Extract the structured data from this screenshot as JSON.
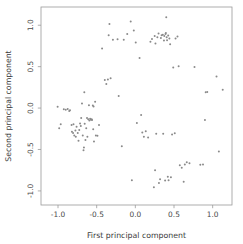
{
  "chart_data": {
    "type": "scatter",
    "title": "",
    "xlabel": "First principal component",
    "ylabel": "Second principal component",
    "xlim": [
      -1.22,
      1.25
    ],
    "ylim": [
      -1.17,
      1.22
    ],
    "xticks": [
      -1.0,
      -0.5,
      0.0,
      0.5,
      1.0
    ],
    "yticks": [
      -1.0,
      -0.5,
      0.0,
      0.5,
      1.0
    ],
    "xticklabels": [
      "-1.0",
      "-0.5",
      "0.0",
      "0.5",
      "1.0"
    ],
    "yticklabels": [
      "-1.0",
      "-0.5",
      "0.0",
      "0.5",
      "1.0"
    ],
    "grid": false,
    "legend": null,
    "marker_color": "#8a8a8a",
    "marker_size": 2.0,
    "n_points": 118,
    "series": [
      {
        "name": "samples",
        "points": [
          [
            -1.005,
            0.015
          ],
          [
            -0.985,
            -0.245
          ],
          [
            -0.965,
            -0.195
          ],
          [
            -0.925,
            -0.015
          ],
          [
            -0.9,
            -0.02
          ],
          [
            -0.875,
            -0.01
          ],
          [
            -0.855,
            -0.035
          ],
          [
            -0.845,
            -0.025
          ],
          [
            -0.825,
            -0.205
          ],
          [
            -0.82,
            -0.285
          ],
          [
            -0.805,
            -0.3
          ],
          [
            -0.8,
            -0.195
          ],
          [
            -0.79,
            -0.33
          ],
          [
            -0.775,
            -0.27
          ],
          [
            -0.77,
            -0.345
          ],
          [
            -0.76,
            -0.225
          ],
          [
            -0.745,
            -0.3
          ],
          [
            -0.735,
            -0.395
          ],
          [
            -0.725,
            -0.265
          ],
          [
            -0.715,
            -0.185
          ],
          [
            -0.705,
            -0.215
          ],
          [
            -0.7,
            -0.12
          ],
          [
            -0.69,
            0.055
          ],
          [
            -0.68,
            -0.33
          ],
          [
            -0.67,
            -0.51
          ],
          [
            -0.665,
            -0.475
          ],
          [
            -0.66,
            0.19
          ],
          [
            -0.655,
            -0.19
          ],
          [
            -0.645,
            -0.385
          ],
          [
            -0.635,
            -0.245
          ],
          [
            -0.625,
            -0.12
          ],
          [
            -0.62,
            -0.345
          ],
          [
            -0.61,
            -0.135
          ],
          [
            -0.6,
            0.035
          ],
          [
            -0.595,
            -0.15
          ],
          [
            -0.585,
            -0.13
          ],
          [
            -0.575,
            -0.14
          ],
          [
            -0.565,
            -0.135
          ],
          [
            -0.56,
            -0.145
          ],
          [
            -0.55,
            0.03
          ],
          [
            -0.545,
            -0.255
          ],
          [
            -0.54,
            0.02
          ],
          [
            -0.535,
            -0.405
          ],
          [
            -0.52,
            0.075
          ],
          [
            -0.51,
            -0.33
          ],
          [
            -0.49,
            -0.335
          ],
          [
            -0.47,
            -0.205
          ],
          [
            -0.43,
            0.72
          ],
          [
            -0.395,
            0.34
          ],
          [
            -0.375,
            0.29
          ],
          [
            -0.355,
            0.345
          ],
          [
            -0.345,
            0.88
          ],
          [
            -0.335,
            1.015
          ],
          [
            -0.32,
            0.36
          ],
          [
            -0.29,
            0.825
          ],
          [
            -0.23,
            0.83
          ],
          [
            -0.215,
            0.145
          ],
          [
            -0.175,
            -0.46
          ],
          [
            -0.15,
            0.825
          ],
          [
            -0.105,
            0.895
          ],
          [
            -0.06,
            1.045
          ],
          [
            -0.045,
            -0.87
          ],
          [
            -0.02,
            0.935
          ],
          [
            0.005,
            0.79
          ],
          [
            0.02,
            -0.18
          ],
          [
            0.055,
            0.605
          ],
          [
            0.075,
            -0.085
          ],
          [
            0.09,
            -0.295
          ],
          [
            0.11,
            -0.345
          ],
          [
            0.135,
            -0.28
          ],
          [
            0.165,
            -0.355
          ],
          [
            0.195,
            0.8
          ],
          [
            0.215,
            0.835
          ],
          [
            0.24,
            -0.955
          ],
          [
            0.25,
            0.87
          ],
          [
            0.255,
            -0.75
          ],
          [
            0.26,
            0.78
          ],
          [
            0.27,
            -0.31
          ],
          [
            0.285,
            0.855
          ],
          [
            0.3,
            0.9
          ],
          [
            0.305,
            -0.905
          ],
          [
            0.32,
            -0.86
          ],
          [
            0.33,
            0.845
          ],
          [
            0.34,
            0.88
          ],
          [
            0.355,
            0.885
          ],
          [
            0.36,
            -0.31
          ],
          [
            0.37,
            0.815
          ],
          [
            0.375,
            0.87
          ],
          [
            0.385,
            -0.875
          ],
          [
            0.39,
            0.895
          ],
          [
            0.395,
            0.905
          ],
          [
            0.4,
            1.095
          ],
          [
            0.405,
            0.855
          ],
          [
            0.41,
            0.82
          ],
          [
            0.42,
            -0.83
          ],
          [
            0.425,
            0.875
          ],
          [
            0.43,
            -0.87
          ],
          [
            0.44,
            0.84
          ],
          [
            0.45,
            0.77
          ],
          [
            0.46,
            -0.835
          ],
          [
            0.475,
            -0.32
          ],
          [
            0.49,
            0.49
          ],
          [
            0.51,
            -0.305
          ],
          [
            0.52,
            0.84
          ],
          [
            0.545,
            0.865
          ],
          [
            0.56,
            0.505
          ],
          [
            0.575,
            -0.69
          ],
          [
            0.6,
            -0.72
          ],
          [
            0.625,
            -0.89
          ],
          [
            0.64,
            -0.68
          ],
          [
            0.665,
            -0.655
          ],
          [
            0.7,
            -0.665
          ],
          [
            0.765,
            0.495
          ],
          [
            0.84,
            -0.685
          ],
          [
            0.875,
            -0.68
          ],
          [
            0.9,
            -0.145
          ],
          [
            0.91,
            0.19
          ],
          [
            0.93,
            0.195
          ],
          [
            1.05,
            0.38
          ],
          [
            1.08,
            -0.525
          ],
          [
            1.13,
            0.22
          ]
        ]
      }
    ]
  },
  "axes": {
    "frame": {
      "left": 41,
      "top": 7,
      "right": 232,
      "bottom": 205
    }
  }
}
